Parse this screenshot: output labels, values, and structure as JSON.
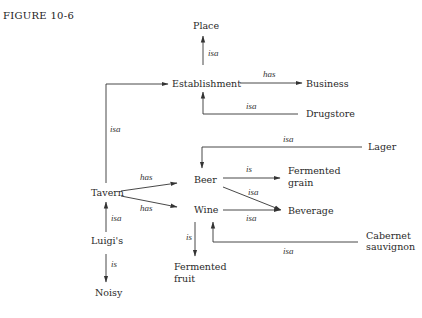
{
  "figure_label": "FIGURE 10-6",
  "nodes": {
    "place": "Place",
    "establishment": "Establishment",
    "business": "Business",
    "drugstore": "Drugstore",
    "lager": "Lager",
    "beer": "Beer",
    "wine": "Wine",
    "fermented_grain_1": "Fermented",
    "fermented_grain_2": "grain",
    "beverage": "Beverage",
    "tavern": "Tavern",
    "cabernet_1": "Cabernet",
    "cabernet_2": "sauvignon",
    "luigis": "Luigi's",
    "noisy": "Noisy",
    "fermented_fruit_1": "Fermented",
    "fermented_fruit_2": "fruit"
  },
  "edges": [
    {
      "from": "Establishment",
      "to": "Place",
      "label": "isa"
    },
    {
      "from": "Establishment",
      "to": "Business",
      "label": "has"
    },
    {
      "from": "Drugstore",
      "to": "Establishment",
      "label": "isa"
    },
    {
      "from": "Tavern",
      "to": "Establishment",
      "label": "isa"
    },
    {
      "from": "Lager",
      "to": "Beer",
      "label": "isa"
    },
    {
      "from": "Beer",
      "to": "Fermented grain",
      "label": "is"
    },
    {
      "from": "Beer",
      "to": "Beverage",
      "label": "isa"
    },
    {
      "from": "Wine",
      "to": "Beverage",
      "label": "isa"
    },
    {
      "from": "Tavern",
      "to": "Beer",
      "label": "has"
    },
    {
      "from": "Tavern",
      "to": "Wine",
      "label": "has"
    },
    {
      "from": "Cabernet sauvignon",
      "to": "Wine",
      "label": "isa"
    },
    {
      "from": "Wine",
      "to": "Fermented fruit",
      "label": "is"
    },
    {
      "from": "Luigi's",
      "to": "Tavern",
      "label": "isa"
    },
    {
      "from": "Luigi's",
      "to": "Noisy",
      "label": "is"
    }
  ],
  "labels": {
    "isa": "isa",
    "has": "has",
    "is": "is"
  }
}
